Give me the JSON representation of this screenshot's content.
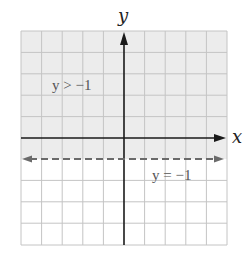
{
  "graph": {
    "x_axis_label": "x",
    "y_axis_label": "y",
    "inequality_label": "y > −1",
    "boundary_label": "y = −1",
    "x_range": [
      -5,
      5
    ],
    "y_range": [
      -5,
      5
    ],
    "grid_step": 1,
    "boundary": {
      "equation": "y = -1",
      "style": "dashed"
    },
    "shaded_region": "y > -1",
    "colors": {
      "shading": "#ececec",
      "grid": "#c4c4c4",
      "axis": "#1a1a1a",
      "boundary": "#6a6a6a",
      "background": "#ffffff"
    }
  }
}
